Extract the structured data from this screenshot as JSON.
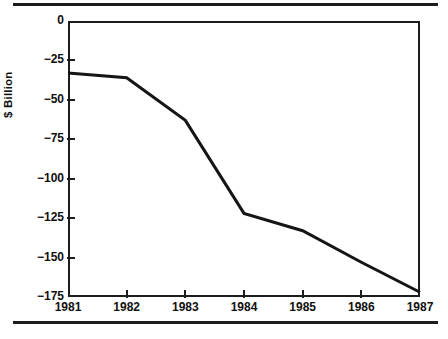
{
  "chart_data": {
    "type": "line",
    "title": "",
    "subtitle": "",
    "xlabel": "",
    "ylabel": "$ Billion",
    "categories": [
      "1981",
      "1982",
      "1983",
      "1984",
      "1985",
      "1986",
      "1987"
    ],
    "x": [
      1981,
      1982,
      1983,
      1984,
      1985,
      1986,
      1987
    ],
    "values": [
      -33,
      -36,
      -63,
      -122,
      -133,
      -153,
      -172
    ],
    "series": [
      {
        "name": "Deficit",
        "values": [
          -33,
          -36,
          -63,
          -122,
          -133,
          -153,
          -172
        ]
      }
    ],
    "ylim": [
      -175,
      0
    ],
    "xlim": [
      1981,
      1987
    ],
    "yticks": [
      0,
      -25,
      -50,
      -75,
      -100,
      -125,
      -150,
      -175
    ],
    "ytick_labels": [
      "0",
      "−25",
      "−50",
      "−75",
      "−100",
      "−125",
      "−150",
      "−175"
    ],
    "xticks": [
      1981,
      1982,
      1983,
      1984,
      1985,
      1986,
      1987
    ],
    "xtick_labels": [
      "1981",
      "1982",
      "1983",
      "1984",
      "1985",
      "1986",
      "1987"
    ],
    "grid": false,
    "legend": null,
    "legend_position": "none",
    "annotations": [],
    "line_color": "#151515",
    "line_width": 3,
    "frame_color": "#1d1d1d",
    "background_color": "#ffffff",
    "text_color": "#101010"
  },
  "decorations": {
    "top_rule": true,
    "bottom_rule": true,
    "rule_color": "#1c1c1c"
  }
}
